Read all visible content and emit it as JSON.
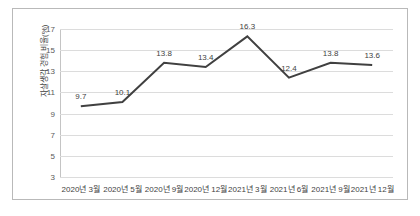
{
  "chart_data": {
    "type": "line",
    "title": "",
    "xlabel": "",
    "ylabel": "자살생각 경험 비율(%)",
    "categories": [
      "2020년 3월",
      "2020년 5월",
      "2020년 9월",
      "2020년 12월",
      "2021년 3월",
      "2021년 6월",
      "2021년 9월",
      "2021년 12월"
    ],
    "values": [
      9.7,
      10.1,
      13.8,
      13.4,
      16.3,
      12.4,
      13.8,
      13.6
    ],
    "point_labels": [
      "9.7",
      "10.1",
      "13.8",
      "13.4",
      "16.3",
      "12.4",
      "13.8",
      "13.6"
    ],
    "ylim": [
      3,
      17
    ],
    "yticks": [
      3,
      5,
      7,
      9,
      11,
      13,
      15,
      17
    ],
    "ytick_labels": [
      "3",
      "5",
      "7",
      "9",
      "11",
      "13",
      "15",
      "17"
    ],
    "grid": true,
    "legend": false,
    "series_color": "#404040",
    "gridline_color": "#dcdcdc",
    "frame_color": "#b9b9b9"
  }
}
